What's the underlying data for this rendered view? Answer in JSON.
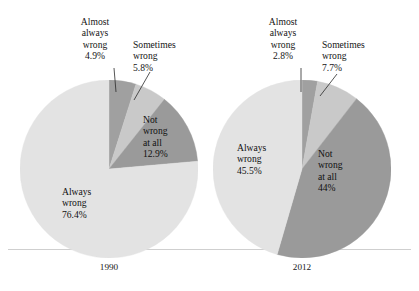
{
  "figure": {
    "background_color": "#ffffff",
    "baseline_color": "#cfcfcf"
  },
  "palette": {
    "always_wrong": "#e3e3e3",
    "almost_always_wrong": "#a0a0a0",
    "sometimes_wrong": "#c9c9c9",
    "not_wrong_at_all": "#9a9a9a",
    "text": "#141414"
  },
  "charts": [
    {
      "id": "pie-1990",
      "year_label": "1990",
      "center": {
        "x": 109,
        "y": 169
      },
      "radius": 89,
      "slices": [
        {
          "key": "almost-always-wrong",
          "name_line1": "Almost",
          "name_line2": "always",
          "name_line3": "wrong",
          "value_label": "4.9%",
          "value": 4.9,
          "color": "#a0a0a0",
          "label_placement": "outside"
        },
        {
          "key": "sometimes-wrong",
          "name_line1": "Sometimes",
          "name_line2": "wrong",
          "name_line3": "",
          "value_label": "5.8%",
          "value": 5.8,
          "color": "#c9c9c9",
          "label_placement": "outside"
        },
        {
          "key": "not-wrong-at-all",
          "name_line1": "Not",
          "name_line2": "wrong",
          "name_line3": "at all",
          "value_label": "12.9%",
          "value": 12.9,
          "color": "#9a9a9a",
          "label_placement": "inside"
        },
        {
          "key": "always-wrong",
          "name_line1": "Always",
          "name_line2": "wrong",
          "name_line3": "",
          "value_label": "76.4%",
          "value": 76.4,
          "color": "#e3e3e3",
          "label_placement": "inside"
        }
      ]
    },
    {
      "id": "pie-2012",
      "year_label": "2012",
      "center": {
        "x": 302,
        "y": 169
      },
      "radius": 89,
      "slices": [
        {
          "key": "almost-always-wrong",
          "name_line1": "Almost",
          "name_line2": "always",
          "name_line3": "wrong",
          "value_label": "2.8%",
          "value": 2.8,
          "color": "#a0a0a0",
          "label_placement": "outside"
        },
        {
          "key": "sometimes-wrong",
          "name_line1": "Sometimes",
          "name_line2": "wrong",
          "name_line3": "",
          "value_label": "7.7%",
          "value": 7.7,
          "color": "#c9c9c9",
          "label_placement": "outside"
        },
        {
          "key": "not-wrong-at-all",
          "name_line1": "Not",
          "name_line2": "wrong",
          "name_line3": "at all",
          "value_label": "44%",
          "value": 44,
          "color": "#9a9a9a",
          "label_placement": "inside"
        },
        {
          "key": "always-wrong",
          "name_line1": "Always",
          "name_line2": "wrong",
          "name_line3": "",
          "value_label": "45.5%",
          "value": 45.5,
          "color": "#e3e3e3",
          "label_placement": "inside"
        }
      ]
    }
  ],
  "chart_data": {
    "type": "pie",
    "title": "",
    "subtitle": "",
    "xlabel": "",
    "ylabel": "",
    "grid": false,
    "legend_position": "none",
    "units": "percent",
    "categories": [
      "Almost always wrong",
      "Sometimes wrong",
      "Not wrong at all",
      "Always wrong"
    ],
    "series": [
      {
        "name": "1990",
        "values": [
          4.9,
          5.8,
          12.9,
          76.4
        ]
      },
      {
        "name": "2012",
        "values": [
          2.8,
          7.7,
          44,
          45.5
        ]
      }
    ],
    "colors": [
      "#a0a0a0",
      "#c9c9c9",
      "#9a9a9a",
      "#e3e3e3"
    ],
    "start_angle_deg": 0,
    "direction": "clockwise",
    "annotations": [
      "1990: Almost always wrong 4.9%",
      "1990: Sometimes wrong 5.8%",
      "1990: Not wrong at all 12.9%",
      "1990: Always wrong 76.4%",
      "2012: Almost always wrong 2.8%",
      "2012: Sometimes wrong 7.7%",
      "2012: Not wrong at all 44%",
      "2012: Always wrong 45.5%"
    ]
  },
  "labels_1990": {
    "almost_always": {
      "l1": "Almost",
      "l2": "always",
      "l3": "wrong",
      "pct": "4.9%"
    },
    "sometimes": {
      "l1": "Sometimes",
      "l2": "wrong",
      "pct": "5.8%"
    },
    "not_wrong": {
      "l1": "Not",
      "l2": "wrong",
      "l3": "at all",
      "pct": "12.9%"
    },
    "always": {
      "l1": "Always",
      "l2": "wrong",
      "pct": "76.4%"
    },
    "year": "1990"
  },
  "labels_2012": {
    "almost_always": {
      "l1": "Almost",
      "l2": "always",
      "l3": "wrong",
      "pct": "2.8%"
    },
    "sometimes": {
      "l1": "Sometimes",
      "l2": "wrong",
      "pct": "7.7%"
    },
    "not_wrong": {
      "l1": "Not",
      "l2": "wrong",
      "l3": "at all",
      "pct": "44%"
    },
    "always": {
      "l1": "Always",
      "l2": "wrong",
      "pct": "45.5%"
    },
    "year": "2012"
  }
}
